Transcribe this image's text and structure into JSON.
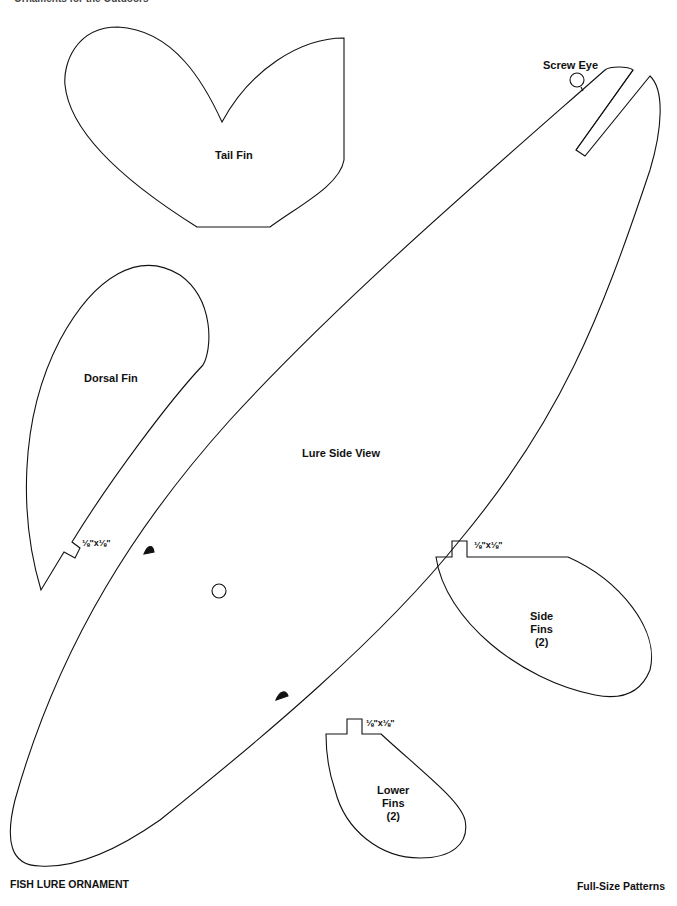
{
  "header": {
    "clipped_text": "Ornaments for the Outdoors"
  },
  "labels": {
    "tail_fin": "Tail Fin",
    "screw_eye": "Screw Eye",
    "dorsal_fin": "Dorsal Fin",
    "lure_side_view": "Lure Side View",
    "side_fins_line1": "Side",
    "side_fins_line2": "Fins",
    "side_fins_line3": "(2)",
    "lower_fins_line1": "Lower",
    "lower_fins_line2": "Fins",
    "lower_fins_line3": "(2)"
  },
  "dimensions": {
    "dorsal_tab": "⅛\"x⅛\"",
    "side_tab": "⅛\"x⅛\"",
    "lower_tab": "⅛\"x⅛\""
  },
  "footer": {
    "title": "FISH LURE ORNAMENT",
    "subtitle": "Full-Size Patterns"
  },
  "colors": {
    "line": "#111111",
    "background": "#ffffff"
  }
}
